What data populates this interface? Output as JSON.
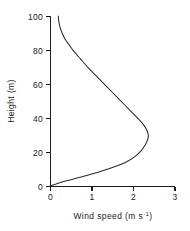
{
  "chart_data": {
    "type": "line",
    "title": "",
    "subtitle": "",
    "xlabel": "Wind speed (m s-1)",
    "xlabel_main": "Wind speed (m s",
    "xlabel_exp": "-1",
    "xlabel_tail": ")",
    "ylabel": "Height (m)",
    "xlim": [
      0,
      3
    ],
    "ylim": [
      0,
      100
    ],
    "xticks": [
      0,
      1,
      2,
      3
    ],
    "xtick_labels": [
      "0",
      "1",
      "2",
      "3"
    ],
    "yticks": [
      0,
      20,
      40,
      60,
      80,
      100
    ],
    "ytick_labels": [
      "0",
      "20",
      "40",
      "60",
      "80",
      "100"
    ],
    "grid": false,
    "legend": null,
    "legend_position": "none",
    "series": [
      {
        "name": "wind speed profile",
        "line_color": "#2b2b2b",
        "x": [
          0.0,
          0.18,
          0.42,
          0.7,
          1.0,
          1.3,
          1.58,
          1.82,
          2.02,
          2.18,
          2.28,
          2.34,
          2.36,
          2.33,
          2.26,
          2.16,
          2.04,
          1.92,
          1.8,
          1.66,
          1.5,
          1.32,
          1.12,
          0.92,
          0.74,
          0.58,
          0.46,
          0.36,
          0.29,
          0.24,
          0.21,
          0.2
        ],
        "y": [
          0.0,
          1.5,
          3.2,
          5.0,
          7.0,
          9.2,
          11.6,
          14.0,
          17.0,
          20.5,
          24.0,
          27.0,
          29.5,
          32.5,
          35.5,
          38.5,
          41.5,
          44.5,
          47.5,
          51.0,
          55.0,
          59.5,
          64.5,
          69.5,
          74.5,
          79.0,
          83.0,
          86.5,
          90.0,
          93.5,
          97.0,
          100.0
        ]
      }
    ],
    "annotations": {
      "max_wind_speed": "2.36",
      "max_wind_speed_height": "27",
      "surface_value": "0",
      "top_value": "0.20"
    },
    "geometry": {
      "origin_x_px": 50,
      "origin_y_px": 186,
      "x_axis_end_px": 175,
      "y_axis_top_px": 16
    }
  }
}
